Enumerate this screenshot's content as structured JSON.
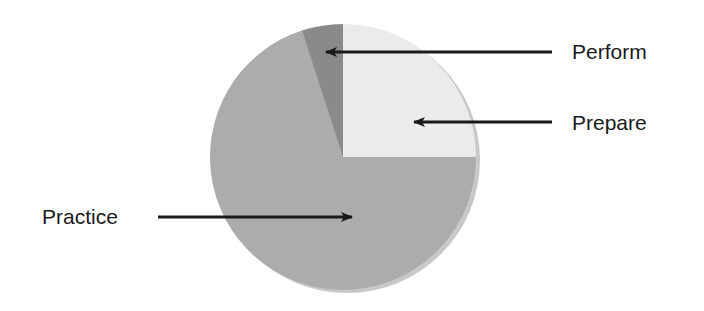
{
  "chart_data": {
    "type": "pie",
    "title": "",
    "categories": [
      "Prepare",
      "Practice",
      "Perform"
    ],
    "values": [
      25,
      70,
      5
    ],
    "unit": "%",
    "start_angle_deg": 0,
    "direction": "clockwise",
    "colors": [
      "#ebebeb",
      "#acacac",
      "#8a8a8a"
    ],
    "legend": "none (arrow callout labels)",
    "annotations": [
      {
        "text": "Perform",
        "points_to": "Perform",
        "side": "right"
      },
      {
        "text": "Prepare",
        "points_to": "Prepare",
        "side": "right"
      },
      {
        "text": "Practice",
        "points_to": "Practice",
        "side": "left"
      }
    ]
  },
  "labels": {
    "perform": "Perform",
    "prepare": "Prepare",
    "practice": "Practice"
  }
}
